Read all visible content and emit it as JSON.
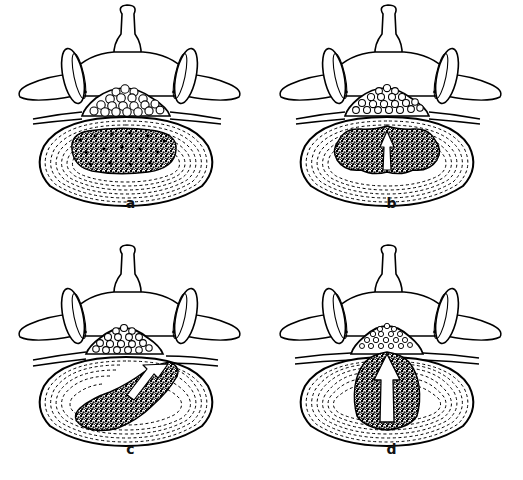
{
  "figure": {
    "background_color": "#ffffff",
    "ink_color": "#000000",
    "layout": "2x2 grid",
    "panel_count": 4
  },
  "panels": [
    {
      "label": "a",
      "name": "normal-disc",
      "caption": "Normal disc",
      "stage": "normal",
      "nucleus_shape": "kidney-shaped, centered",
      "annulus": "intact concentric lamellae",
      "arrow": "none",
      "canal": "patent, cauda equina roots round and evenly spaced"
    },
    {
      "label": "b",
      "name": "disc-protrusion",
      "caption": "Disc protrusion",
      "stage": "protrusion",
      "nucleus_shape": "irregular, expanded posteriorly",
      "annulus": "inner lamellae disrupted, posterior bulge",
      "arrow": "thin white arrow pointing posteriorly",
      "canal": "slightly indented anteriorly"
    },
    {
      "label": "c",
      "name": "posterolateral-extrusion",
      "caption": "Posterolateral extrusion",
      "stage": "extrusion",
      "nucleus_shape": "displaced obliquely toward right posterolateral corner",
      "annulus": "torn on right posterolateral side",
      "arrow": "white arrow tracking up and to the right through the annular tear",
      "canal": "right lateral recess encroached, nerve root compressed"
    },
    {
      "label": "d",
      "name": "central-extrusion",
      "caption": "Massive central extrusion",
      "stage": "massive extrusion",
      "nucleus_shape": "broad wedge driven posteriorly into the canal",
      "annulus": "ruptured centrally",
      "arrow": "broad white arrow pointing posteriorly into the spinal canal",
      "canal": "markedly compressed, cauda equina roots crowded and flattened"
    }
  ],
  "anatomy": {
    "spinous_process": "spinous process",
    "superior_articular_process": "superior articular process",
    "transverse_process": "transverse process",
    "lamina": "lamina",
    "pedicle": "pedicle",
    "spinal_canal": "spinal canal",
    "cauda_equina": "cauda equina nerve roots",
    "nerve_root": "exiting nerve root",
    "vertebral_body": "vertebral body",
    "annulus_fibrosus": "annulus fibrosus",
    "nucleus_pulposus": "nucleus pulposus"
  }
}
